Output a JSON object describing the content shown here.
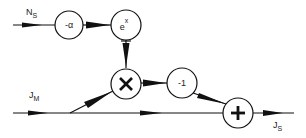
{
  "diagram": {
    "type": "signal-flow block diagram",
    "inputs": [
      {
        "id": "ns",
        "label_main": "N",
        "label_sub": "S"
      },
      {
        "id": "jm",
        "label_main": "J",
        "label_sub": "M"
      }
    ],
    "outputs": [
      {
        "id": "js",
        "label_main": "J",
        "label_sub": "S"
      }
    ],
    "nodes": [
      {
        "id": "neg-alpha",
        "label": "-α"
      },
      {
        "id": "exp",
        "label_main": "e",
        "label_sup": "x"
      },
      {
        "id": "multiply",
        "label": "×"
      },
      {
        "id": "neg-one",
        "label": "-1"
      },
      {
        "id": "sum",
        "label": "+"
      }
    ],
    "edges": [
      {
        "from": "ns",
        "to": "neg-alpha"
      },
      {
        "from": "neg-alpha",
        "to": "exp"
      },
      {
        "from": "exp",
        "to": "multiply"
      },
      {
        "from": "jm",
        "to": "multiply"
      },
      {
        "from": "multiply",
        "to": "neg-one"
      },
      {
        "from": "neg-one",
        "to": "sum"
      },
      {
        "from": "jm",
        "to": "sum"
      },
      {
        "from": "sum",
        "to": "js"
      }
    ]
  }
}
